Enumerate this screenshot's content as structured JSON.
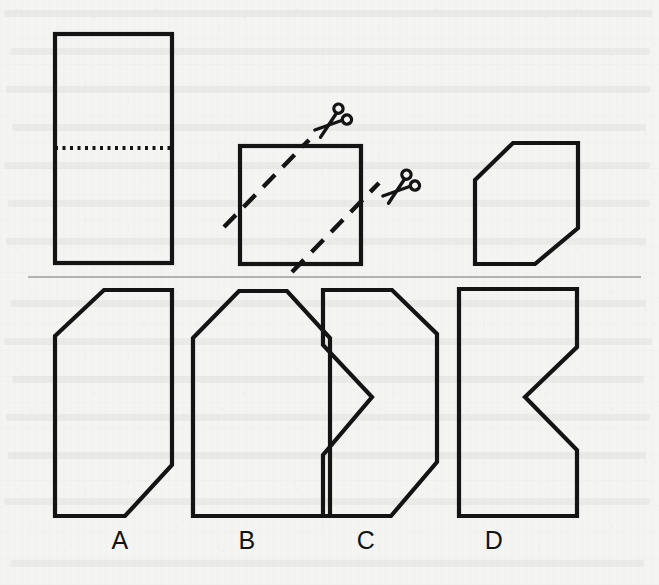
{
  "figure": {
    "kind": "paper-folding-puzzle",
    "background_color": "#f4f4f3",
    "ink_color": "#141414",
    "divider_color": "#9c9c9c",
    "canvas": {
      "width": 659,
      "height": 585
    }
  },
  "prompt_row": {
    "name": "fold-and-cut-sequence",
    "steps": [
      {
        "id": "step-1-fold",
        "description": "Tall rectangle with horizontal dotted fold line across the middle",
        "shape": "rectangle",
        "bounds": {
          "x": 55,
          "y": 34,
          "width": 117,
          "height": 229
        },
        "fold_line": {
          "type": "dotted-horizontal",
          "x1": 55,
          "y1": 148,
          "x2": 172,
          "y2": 148
        }
      },
      {
        "id": "step-2-cut",
        "description": "Folded square with two parallel dashed diagonal cut lines running lower-left to upper-right",
        "shape": "square",
        "bounds": {
          "x": 240,
          "y": 146,
          "width": 121,
          "height": 118
        },
        "cut_lines": [
          {
            "x1": 224,
            "y1": 227,
            "x2": 309,
            "y2": 140
          },
          {
            "x1": 292,
            "y1": 272,
            "x2": 379,
            "y2": 183
          }
        ],
        "scissors": [
          {
            "id": "scissors-upper",
            "x": 330,
            "y": 124
          },
          {
            "id": "scissors-lower",
            "x": 398,
            "y": 190
          }
        ]
      },
      {
        "id": "step-3-result",
        "description": "Resulting hexagon: square with top-left and bottom-right corners cut off",
        "shape": "hexagon",
        "points": "475,180 513,143 578,143 578,228 535,264 475,264"
      }
    ]
  },
  "divider": {
    "name": "section-divider",
    "x1": 28,
    "y1": 277,
    "x2": 641,
    "y2": 277
  },
  "options_row": {
    "name": "answer-choices",
    "count": 4,
    "options": [
      {
        "id": "option-a",
        "label": "A",
        "label_x": 120,
        "label_y": 549,
        "description": "Tall shape with top-left corner cut off and bottom-right corner cut off",
        "points": "55,336 104,290 172,290 172,465 125,516 55,516"
      },
      {
        "id": "option-b",
        "label": "B",
        "label_x": 247,
        "label_y": 549,
        "description": "House / pentagon shape with both top corners cut off",
        "points": "193,338 239,291 287,291 330,338 330,516 193,516"
      },
      {
        "id": "option-c",
        "label": "C",
        "label_x": 366,
        "label_y": 549,
        "description": "Shape with top-right and bottom-right corners cut off and a V-notch cut into the left side",
        "points": "323,290 392,290 437,334 437,462 391,516 323,516 323,455 372,397 323,345"
      },
      {
        "id": "option-d",
        "label": "D",
        "label_x": 494,
        "label_y": 549,
        "description": "Rectangle with a V-notch cut into the right side",
        "points": "459,289 577,289 577,347 525,397 577,450 577,516 459,516"
      }
    ]
  },
  "icons": {
    "scissors": {
      "name": "scissors-icon",
      "semantic": "cut-here"
    },
    "fold": {
      "name": "fold-line-icon",
      "semantic": "dotted-fold"
    }
  }
}
